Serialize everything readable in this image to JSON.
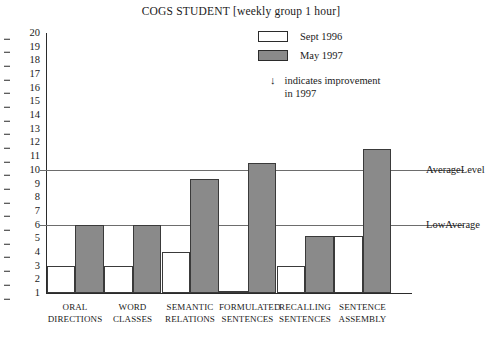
{
  "chart_data": {
    "type": "bar",
    "title": "COGS STUDENT [weekly group 1 hour]",
    "xlabel": "",
    "ylabel": "",
    "ylim": [
      1,
      20
    ],
    "grid": false,
    "legend_position": "top-right",
    "categories": [
      "ORAL DIRECTIONS",
      "WORD CLASSES",
      "SEMANTIC RELATIONS",
      "FORMULATED SENTENCES",
      "RECALLING SENTENCES",
      "SENTENCE ASSEMBLY"
    ],
    "category_lines": [
      [
        "ORAL",
        "DIRECTIONS"
      ],
      [
        "WORD",
        "CLASSES"
      ],
      [
        "SEMANTIC",
        "RELATIONS"
      ],
      [
        "FORMULATED",
        "SENTENCES"
      ],
      [
        "RECALLING",
        "SENTENCES"
      ],
      [
        "SENTENCE",
        "ASSEMBLY"
      ]
    ],
    "series": [
      {
        "name": "Sept 1996",
        "color": "#ffffff",
        "values": [
          3,
          3,
          4,
          1,
          3,
          5.2
        ]
      },
      {
        "name": "May 1997",
        "color": "#8a8a8a",
        "values": [
          6,
          6,
          9.3,
          10.5,
          5.2,
          11.5
        ]
      }
    ],
    "y_ticks": [
      20,
      19,
      18,
      17,
      16,
      15,
      14,
      13,
      12,
      11,
      10,
      9,
      8,
      7,
      6,
      5,
      4,
      3,
      2,
      1
    ],
    "reference_lines": [
      {
        "value": 10,
        "label_lines": [
          "Average",
          "Level"
        ]
      },
      {
        "value": 6,
        "label_lines": [
          "Low",
          "Average"
        ]
      }
    ],
    "annotations": [
      {
        "symbol": "↓",
        "lines": [
          "indicates improvement",
          "in 1997"
        ]
      }
    ]
  }
}
